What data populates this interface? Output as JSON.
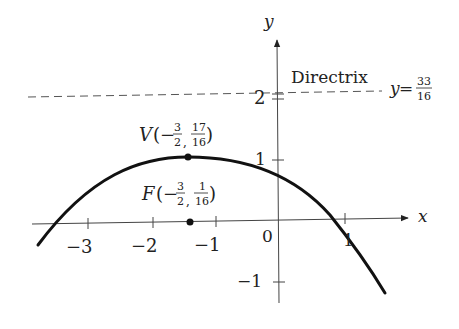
{
  "diagram": {
    "type": "parabola-plot",
    "equation_note": "Parabola with vertex V and focus F, opening downward",
    "axes": {
      "x_label": "x",
      "y_label": "y",
      "x_ticks": [
        {
          "value": -3,
          "label": "−3"
        },
        {
          "value": -2,
          "label": "−2"
        },
        {
          "value": -1,
          "label": "−1"
        },
        {
          "value": 0,
          "label": "0"
        },
        {
          "value": 1,
          "label": "1"
        }
      ],
      "y_ticks": [
        {
          "value": -1,
          "label": "−1"
        },
        {
          "value": 1,
          "label": "1"
        },
        {
          "value": 2,
          "label": "2"
        }
      ]
    },
    "vertex": {
      "name": "V",
      "x_num": "3",
      "x_den": "2",
      "x_sign": "−",
      "y_num": "17",
      "y_den": "16",
      "x": -1.5,
      "y": 1.0625
    },
    "focus": {
      "name": "F",
      "x_num": "3",
      "x_den": "2",
      "x_sign": "−",
      "y_num": "1",
      "y_den": "16",
      "x": -1.5,
      "y": 0.0625
    },
    "directrix": {
      "label": "Directrix",
      "eq_var": "y",
      "eq_sign": "=",
      "eq_num": "33",
      "eq_den": "16",
      "y": 2.0625
    },
    "colors": {
      "curve": "#111111",
      "axes": "#444444",
      "directrix": "#555555",
      "text": "#222222"
    }
  }
}
